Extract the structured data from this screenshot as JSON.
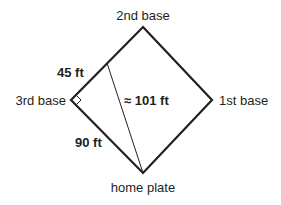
{
  "diagram": {
    "vertices": {
      "second_base": {
        "label": "2nd base",
        "x": 143,
        "y": 27
      },
      "first_base": {
        "label": "1st base",
        "x": 212,
        "y": 100
      },
      "home_plate": {
        "label": "home plate",
        "x": 143,
        "y": 173
      },
      "third_base": {
        "label": "3rd base",
        "x": 71,
        "y": 100
      }
    },
    "midpoint": {
      "x": 107,
      "y": 63
    },
    "measurements": {
      "half_side": "45 ft",
      "full_side": "90 ft",
      "diagonal": "≈ 101 ft"
    },
    "right_angle_marker_at": "3rd base",
    "colors": {
      "stroke": "#231f20",
      "text": "#231f20",
      "background": "#ffffff"
    }
  }
}
